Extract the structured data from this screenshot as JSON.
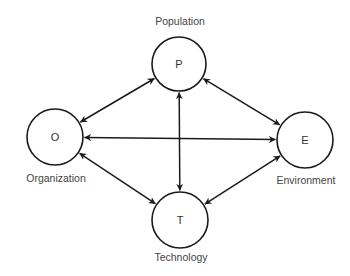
{
  "diagram": {
    "type": "relationship-diagram",
    "nodes": [
      {
        "id": "P",
        "letter": "P",
        "label": "Population",
        "cx": 179,
        "cy": 64,
        "r": 27,
        "label_x": 180,
        "label_y": 21
      },
      {
        "id": "O",
        "letter": "O",
        "label": "Organization",
        "cx": 55,
        "cy": 137,
        "r": 28,
        "label_x": 56,
        "label_y": 178
      },
      {
        "id": "E",
        "letter": "E",
        "label": "Environment",
        "cx": 305,
        "cy": 140,
        "r": 28,
        "label_x": 306,
        "label_y": 180
      },
      {
        "id": "T",
        "letter": "T",
        "label": "Technology",
        "cx": 180,
        "cy": 220,
        "r": 28,
        "label_x": 181,
        "label_y": 257
      }
    ],
    "edges": [
      {
        "from": "O",
        "to": "P",
        "bidirectional": true
      },
      {
        "from": "O",
        "to": "E",
        "bidirectional": true
      },
      {
        "from": "O",
        "to": "T",
        "bidirectional": true
      },
      {
        "from": "P",
        "to": "E",
        "bidirectional": true
      },
      {
        "from": "P",
        "to": "T",
        "bidirectional": true
      },
      {
        "from": "T",
        "to": "E",
        "bidirectional": true
      }
    ],
    "colors": {
      "stroke": "#1a1a1a",
      "text": "#444444",
      "background": "#ffffff"
    }
  }
}
